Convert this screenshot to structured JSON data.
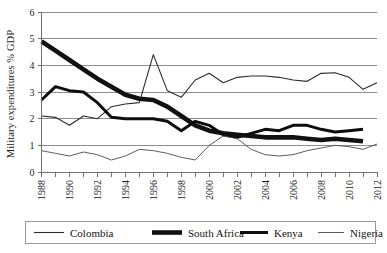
{
  "chart_data": {
    "type": "line",
    "title": "",
    "xlabel": "",
    "ylabel": "Military expenditures % GDP",
    "ylim": [
      0,
      6
    ],
    "xlim": [
      1988,
      2012
    ],
    "yticks": [
      0,
      1,
      2,
      3,
      4,
      5,
      6
    ],
    "grid": true,
    "legend_position": "bottom",
    "x": [
      1988,
      1989,
      1990,
      1991,
      1992,
      1993,
      1994,
      1995,
      1996,
      1997,
      1998,
      1999,
      2000,
      2001,
      2002,
      2003,
      2004,
      2005,
      2006,
      2007,
      2008,
      2009,
      2010,
      2011,
      2012
    ],
    "xtick_labels": [
      "1988",
      "1990",
      "1992",
      "1994",
      "1996",
      "1998",
      "2000",
      "2002",
      "2004",
      "2006",
      "2008",
      "2010",
      "2012"
    ],
    "series": [
      {
        "name": "Colombia",
        "style": "thin",
        "color": "#2b2b2b",
        "width": 1.1,
        "values": [
          2.1,
          2.05,
          1.75,
          2.1,
          2.0,
          2.45,
          2.55,
          2.6,
          4.4,
          3.05,
          2.8,
          3.45,
          3.7,
          3.35,
          3.55,
          3.6,
          3.6,
          3.55,
          3.45,
          3.4,
          3.7,
          3.72,
          3.55,
          3.1,
          3.35
        ]
      },
      {
        "name": "South Africa",
        "style": "very-thick",
        "color": "#111111",
        "width": 4.6,
        "values": [
          4.9,
          4.55,
          4.2,
          3.85,
          3.5,
          3.2,
          2.9,
          2.75,
          2.7,
          2.45,
          2.1,
          1.75,
          1.55,
          1.45,
          1.4,
          1.35,
          1.3,
          1.3,
          1.3,
          1.25,
          1.2,
          1.25,
          1.2,
          1.15,
          null
        ]
      },
      {
        "name": "Kenya",
        "style": "thick",
        "color": "#0d0d0d",
        "width": 3.0,
        "values": [
          2.7,
          3.2,
          3.05,
          3.0,
          2.6,
          2.05,
          2.0,
          2.0,
          2.0,
          1.9,
          1.55,
          1.9,
          1.75,
          1.4,
          1.3,
          1.45,
          1.6,
          1.55,
          1.75,
          1.75,
          1.6,
          1.5,
          1.55,
          1.6,
          null
        ]
      },
      {
        "name": "Nigeria",
        "style": "hairline",
        "color": "#4a4a4a",
        "width": 0.9,
        "values": [
          0.8,
          0.7,
          0.6,
          0.75,
          0.65,
          0.45,
          0.6,
          0.85,
          0.8,
          0.7,
          0.55,
          0.45,
          1.0,
          1.35,
          1.25,
          0.85,
          0.65,
          0.6,
          0.65,
          0.8,
          0.9,
          1.0,
          0.95,
          0.85,
          1.05
        ]
      }
    ]
  },
  "legend": {
    "entries": [
      {
        "label": "Colombia"
      },
      {
        "label": "South Africa"
      },
      {
        "label": "Kenya"
      },
      {
        "label": "Nigeria"
      }
    ]
  }
}
